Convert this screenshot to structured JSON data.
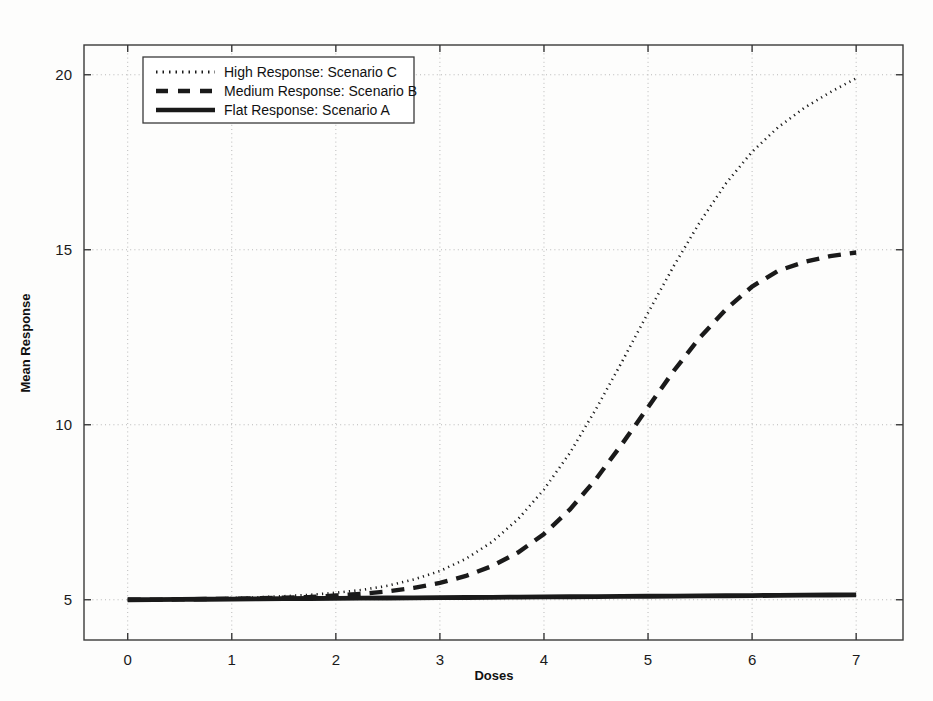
{
  "figure": {
    "background_color": "#fdfdfc",
    "frame_color": "#3a3a3a",
    "grid_color": "#b9b9b9"
  },
  "chart_data": {
    "type": "line",
    "title": "",
    "xlabel": "Doses",
    "ylabel": "Mean Response",
    "xlim": [
      -0.42,
      7.45
    ],
    "ylim": [
      3.85,
      20.85
    ],
    "xticks": [
      0,
      1,
      2,
      3,
      4,
      5,
      6,
      7
    ],
    "xtick_labels": [
      "0",
      "1",
      "2",
      "3",
      "4",
      "5",
      "6",
      "7"
    ],
    "yticks": [
      5,
      10,
      15,
      20
    ],
    "ytick_labels": [
      "5",
      "10",
      "15",
      "20"
    ],
    "grid": true,
    "grid_style": "dotted",
    "legend_position": "top-left",
    "x": [
      0,
      0.25,
      0.5,
      0.75,
      1,
      1.25,
      1.5,
      1.75,
      2,
      2.25,
      2.5,
      2.75,
      3,
      3.25,
      3.5,
      3.75,
      4,
      4.25,
      4.5,
      4.75,
      5,
      5.25,
      5.5,
      5.75,
      6,
      6.25,
      6.5,
      6.75,
      7
    ],
    "series": [
      {
        "name": "High Response: Scenario C",
        "label": "High Response: Scenario C",
        "style": "dotted",
        "color": "#1a1a1a",
        "width": 2.6,
        "dasharray": "1.2 4.2",
        "legend_key": "dotted-line-swatch",
        "values": [
          5.0,
          5.01,
          5.02,
          5.03,
          5.05,
          5.07,
          5.1,
          5.14,
          5.2,
          5.28,
          5.4,
          5.58,
          5.82,
          6.17,
          6.65,
          7.3,
          8.15,
          9.2,
          10.45,
          11.8,
          13.2,
          14.55,
          15.8,
          16.9,
          17.8,
          18.5,
          19.05,
          19.5,
          19.9
        ]
      },
      {
        "name": "Medium Response: Scenario B",
        "label": "Medium Response: Scenario B",
        "style": "dashed",
        "color": "#1a1a1a",
        "width": 4.4,
        "dasharray": "13 9",
        "legend_key": "dashed-line-swatch",
        "values": [
          5.0,
          5.0,
          5.01,
          5.02,
          5.03,
          5.04,
          5.06,
          5.08,
          5.12,
          5.17,
          5.24,
          5.34,
          5.48,
          5.68,
          5.96,
          6.35,
          6.88,
          7.58,
          8.45,
          9.45,
          10.5,
          11.55,
          12.5,
          13.3,
          13.95,
          14.4,
          14.65,
          14.82,
          14.92
        ]
      },
      {
        "name": "Flat Response: Scenario A",
        "label": "Flat Response: Scenario A",
        "style": "solid",
        "color": "#1a1a1a",
        "width": 4.8,
        "dasharray": "",
        "legend_key": "solid-line-swatch",
        "values": [
          5.0,
          5.005,
          5.01,
          5.015,
          5.02,
          5.025,
          5.03,
          5.035,
          5.04,
          5.045,
          5.05,
          5.055,
          5.06,
          5.065,
          5.07,
          5.075,
          5.08,
          5.085,
          5.09,
          5.095,
          5.1,
          5.105,
          5.11,
          5.115,
          5.12,
          5.125,
          5.13,
          5.135,
          5.14
        ]
      }
    ]
  },
  "legend": {
    "items": [
      {
        "label": "High Response: Scenario C",
        "style": "dotted"
      },
      {
        "label": "Medium Response: Scenario B",
        "style": "dashed"
      },
      {
        "label": "Flat Response: Scenario A",
        "style": "solid"
      }
    ]
  }
}
